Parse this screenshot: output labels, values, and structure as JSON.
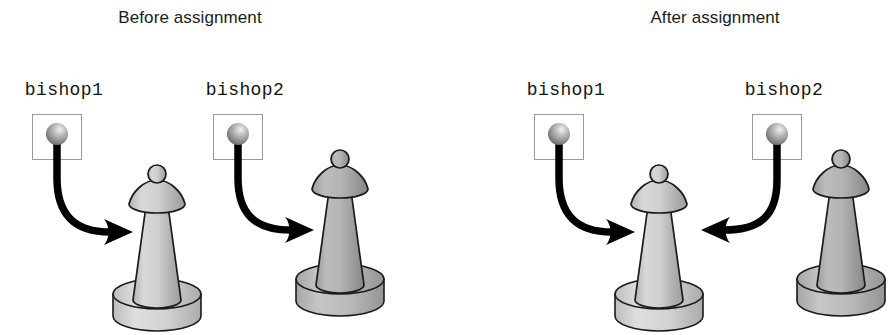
{
  "figure": {
    "title_before": "Before assignment",
    "title_after": "After assignment",
    "background_color": "#ffffff"
  },
  "panels": [
    {
      "id": "before",
      "title": "Before assignment",
      "title_center_x": 190,
      "title_y": 8,
      "variables": [
        {
          "name": "bishop1",
          "label": "bishop1",
          "label_center_x": 64,
          "label_y": 80,
          "box": {
            "x": 32,
            "y": 114,
            "w": 50,
            "h": 46
          },
          "ball_color": "#8f8f8f",
          "ball_highlight": "#e8e8e8",
          "points_to": "piece-a"
        },
        {
          "name": "bishop2",
          "label": "bishop2",
          "label_center_x": 245,
          "label_y": 80,
          "box": {
            "x": 213,
            "y": 114,
            "w": 50,
            "h": 46
          },
          "ball_color": "#8f8f8f",
          "ball_highlight": "#e8e8e8",
          "points_to": "piece-b"
        }
      ],
      "pieces": [
        {
          "id": "piece-a",
          "kind": "bishop",
          "x": 157,
          "y": 166,
          "fill": "#c9c9c9",
          "base_fill": "#d2d2d2"
        },
        {
          "id": "piece-b",
          "kind": "bishop",
          "x": 340,
          "y": 151,
          "fill": "#b0b0b0",
          "base_fill": "#bcbcbc"
        }
      ],
      "arrows": [
        {
          "from": "bishop1",
          "to": "piece-a",
          "direction": "right",
          "color": "#000000"
        },
        {
          "from": "bishop2",
          "to": "piece-b",
          "direction": "right",
          "color": "#000000"
        }
      ]
    },
    {
      "id": "after",
      "title": "After assignment",
      "title_center_x": 715,
      "title_y": 8,
      "variables": [
        {
          "name": "bishop1",
          "label": "bishop1",
          "label_center_x": 566,
          "label_y": 80,
          "box": {
            "x": 534,
            "y": 114,
            "w": 50,
            "h": 46
          },
          "ball_color": "#8f8f8f",
          "ball_highlight": "#e8e8e8",
          "points_to": "piece-c"
        },
        {
          "name": "bishop2",
          "label": "bishop2",
          "label_center_x": 784,
          "label_y": 80,
          "box": {
            "x": 752,
            "y": 114,
            "w": 50,
            "h": 46
          },
          "ball_color": "#8f8f8f",
          "ball_highlight": "#e8e8e8",
          "points_to": "piece-c"
        }
      ],
      "pieces": [
        {
          "id": "piece-c",
          "kind": "bishop",
          "x": 659,
          "y": 166,
          "fill": "#c9c9c9",
          "base_fill": "#d2d2d2"
        },
        {
          "id": "piece-d",
          "kind": "bishop",
          "x": 841,
          "y": 151,
          "fill": "#b0b0b0",
          "base_fill": "#bcbcbc"
        }
      ],
      "arrows": [
        {
          "from": "bishop1",
          "to": "piece-c",
          "direction": "right",
          "color": "#000000"
        },
        {
          "from": "bishop2",
          "to": "piece-c",
          "direction": "left",
          "color": "#000000"
        }
      ]
    }
  ],
  "colors": {
    "text": "#1b1b1b",
    "box_border": "#9a9a9a",
    "arrow": "#000000",
    "piece_light": "#c9c9c9",
    "piece_dark": "#b0b0b0",
    "outline": "#1a1a1a"
  }
}
